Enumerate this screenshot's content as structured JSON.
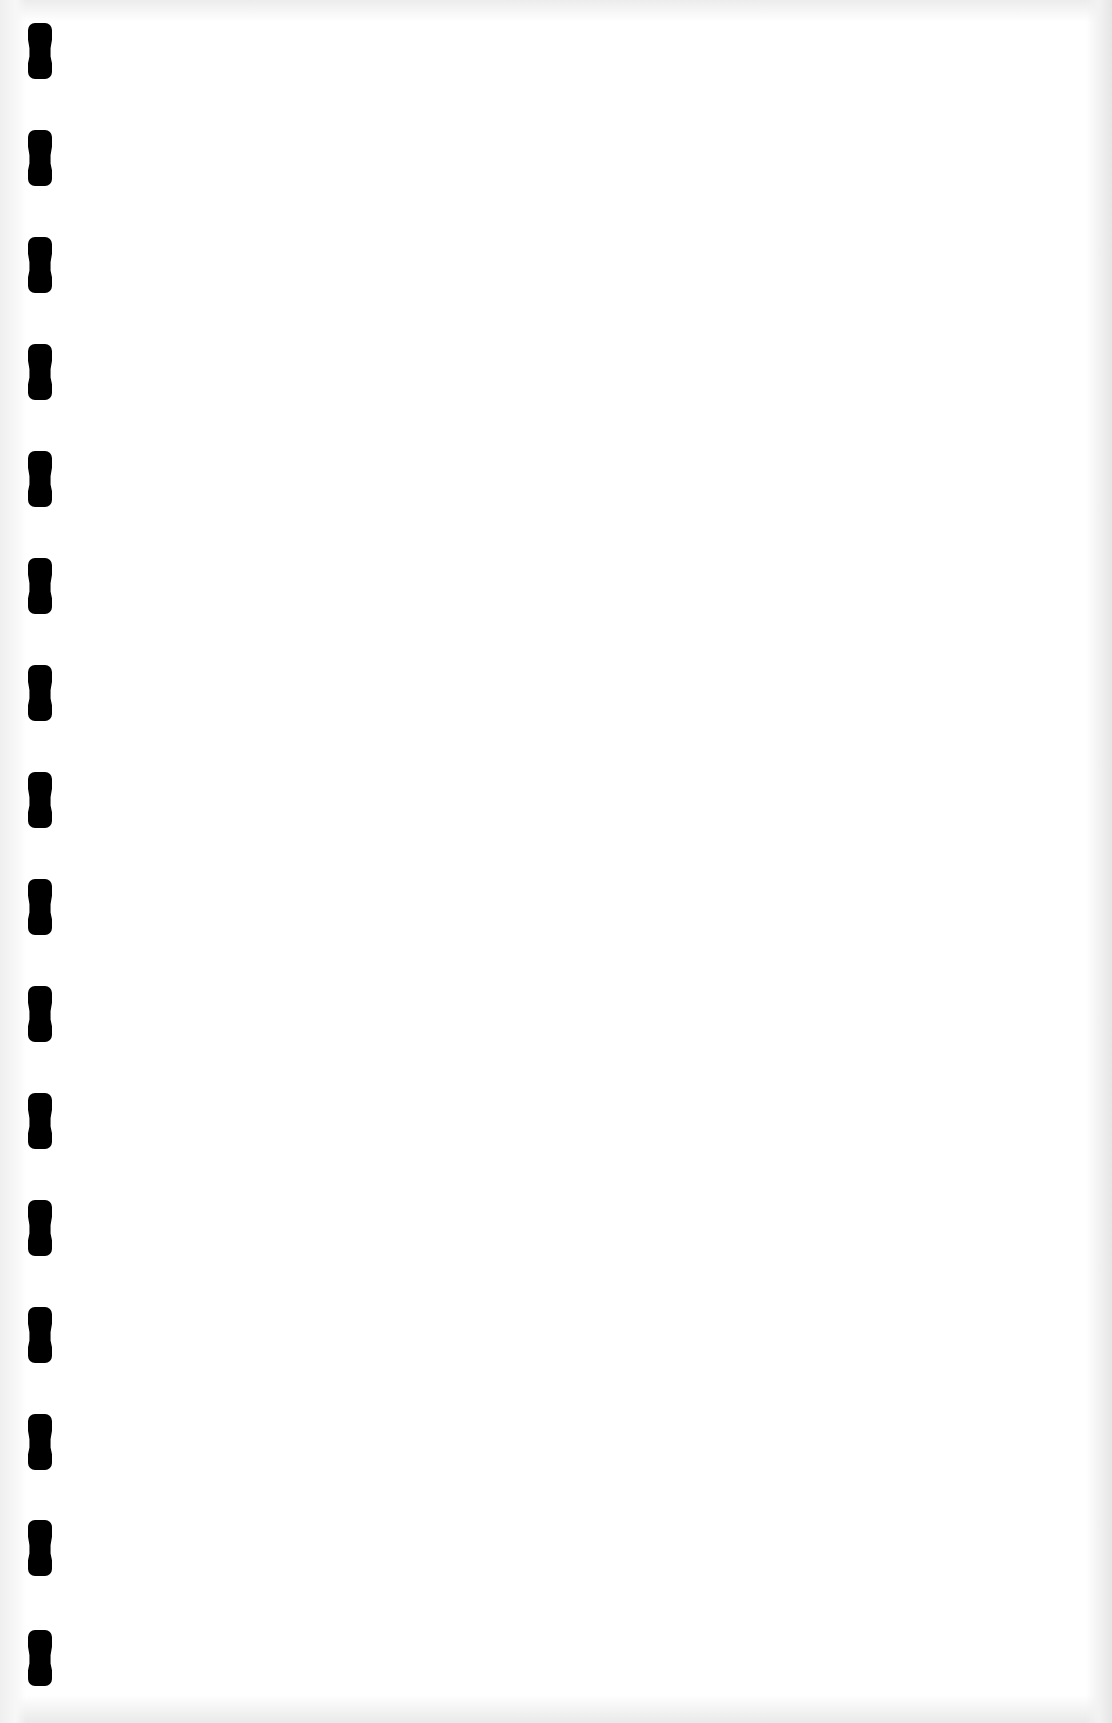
{
  "page": {
    "type": "blank-scanned-page",
    "background_color": "#ffffff",
    "edge_shade_color": "#ececec"
  },
  "binding": {
    "hole_color": "#000000",
    "hole_count": 16,
    "hole_left_px": 28,
    "hole_width_px": 24,
    "hole_height_px": 56,
    "hole_tops_px": [
      23,
      130,
      237,
      344,
      451,
      558,
      665,
      772,
      879,
      986,
      1093,
      1200,
      1307,
      1414,
      1520,
      1630
    ]
  }
}
